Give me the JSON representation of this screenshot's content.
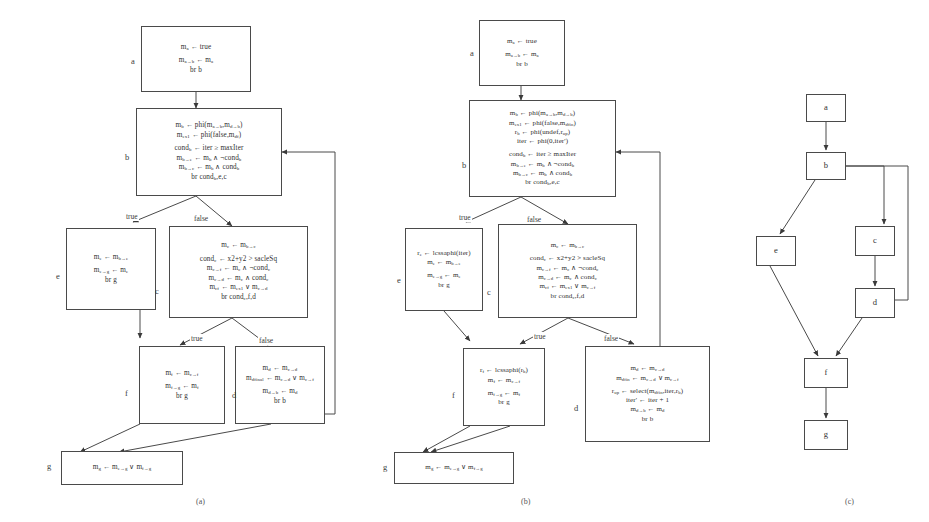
{
  "figure": {
    "captions": [
      {
        "text": "(a)",
        "x": 196,
        "y": 497
      },
      {
        "text": "(b)",
        "x": 521,
        "y": 497
      },
      {
        "text": "(c)",
        "x": 845,
        "y": 497
      }
    ]
  },
  "panel_a": {
    "name": "original-ssa-cfg",
    "labels": [
      {
        "text": "a",
        "x": 131,
        "y": 56
      },
      {
        "text": "b",
        "x": 125,
        "y": 152
      },
      {
        "text": "e",
        "x": 56,
        "y": 271
      },
      {
        "text": "c",
        "x": 155,
        "y": 286
      },
      {
        "text": "f",
        "x": 125,
        "y": 388
      },
      {
        "text": "d",
        "x": 232,
        "y": 390
      },
      {
        "text": "g",
        "x": 47,
        "y": 461
      }
    ],
    "edge_labels": [
      {
        "text": "true",
        "x": 125,
        "y": 212
      },
      {
        "text": "false",
        "x": 193,
        "y": 214
      },
      {
        "text": "true",
        "x": 190,
        "y": 334
      },
      {
        "text": "false",
        "x": 258,
        "y": 336
      }
    ],
    "blocks": {
      "a": {
        "lines": [
          "m<sub>a</sub> ← true",
          "",
          "m<sub>a→b</sub> ← m<sub>a</sub>",
          "br b"
        ]
      },
      "b": {
        "lines": [
          "m<sub>b</sub> ← phi(m<sub>a→b</sub>,m<sub>d→b</sub>)",
          "m<sub>ex1</sub> ← phi(false,m<sub>df</sub>)",
          "",
          "cond<sub>b</sub> ← iter ≥ maxIter",
          "m<sub>b→e</sub> ← m<sub>b</sub> ∧ ¬cond<sub>b</sub>",
          "m<sub>b→c</sub> ← m<sub>b</sub> ∧ cond<sub>b</sub>",
          "br cond<sub>b</sub>,e,c"
        ]
      },
      "e": {
        "lines": [
          "m<sub>e</sub> ← m<sub>b→e</sub>",
          "",
          "m<sub>e→g</sub> ← m<sub>e</sub>",
          "br g"
        ]
      },
      "c": {
        "lines": [
          "m<sub>c</sub> ← m<sub>b→c</sub>",
          "",
          "cond<sub>c</sub> ← x2+y2 &gt; sacleSq",
          "m<sub>c→f</sub> ← m<sub>c</sub> ∧ ¬cond<sub>c</sub>",
          "m<sub>c→d</sub> ← m<sub>c</sub> ∧ cond<sub>c</sub>",
          "m<sub>cf</sub> ← m<sub>ex1</sub> ∨ m<sub>c→d</sub>",
          "br cond<sub>c</sub>,f,d"
        ]
      },
      "f": {
        "lines": [
          "m<sub>f</sub> ← m<sub>c→f</sub>",
          "",
          "m<sub>f→g</sub> ← m<sub>f</sub>",
          "br g"
        ]
      },
      "d": {
        "lines": [
          "m<sub>d</sub> ← m<sub>c→d</sub>",
          "m<sub>dfinal</sub> ← m<sub>c→d</sub> ∨ m<sub>c→f</sub>",
          "",
          "m<sub>d→b</sub> ← m<sub>d</sub>",
          "br b"
        ]
      },
      "g": {
        "lines": [
          "m<sub>g</sub> ← m<sub>e→g</sub> ∨ m<sub>f→g</sub>"
        ]
      }
    }
  },
  "panel_b": {
    "name": "transformed-ssa-cfg",
    "labels": [
      {
        "text": "a",
        "x": 470,
        "y": 48
      },
      {
        "text": "b",
        "x": 462,
        "y": 160
      },
      {
        "text": "e",
        "x": 397,
        "y": 275
      },
      {
        "text": "c",
        "x": 487,
        "y": 287
      },
      {
        "text": "f",
        "x": 452,
        "y": 390
      },
      {
        "text": "d",
        "x": 574,
        "y": 403
      },
      {
        "text": "g",
        "x": 383,
        "y": 462
      }
    ],
    "edge_labels": [
      {
        "text": "true",
        "x": 458,
        "y": 213
      },
      {
        "text": "false",
        "x": 526,
        "y": 215
      },
      {
        "text": "true",
        "x": 533,
        "y": 332
      },
      {
        "text": "false",
        "x": 603,
        "y": 334
      }
    ],
    "blocks": {
      "a": {
        "lines": [
          "m<sub>a</sub> ← true",
          "",
          "m<sub>a→b</sub> ← m<sub>a</sub>",
          "br b"
        ]
      },
      "b": {
        "lines": [
          "m<sub>b</sub> ← phi(m<sub>a→b</sub>,m<sub>d→b</sub>)",
          "m<sub>ex1</sub> ← phi(false,m<sub>dfin</sub>)",
          "r<sub>b</sub> ← phi(undef,r<sub>up</sub>)",
          "iter ← phi(0,iter')",
          "",
          "cond<sub>b</sub> ← iter ≥ maxIter",
          "m<sub>b→e</sub> ← m<sub>b</sub> ∧ ¬cond<sub>b</sub>",
          "m<sub>b→c</sub> ← m<sub>b</sub> ∧ cond<sub>b</sub>",
          "br cond<sub>b</sub>,e,c"
        ]
      },
      "e": {
        "lines": [
          "r<sub>e</sub> ← lcssaphi(iter)",
          "m<sub>e</sub> ← m<sub>b→e</sub>",
          "",
          "m<sub>e→g</sub> ← m<sub>e</sub>",
          "br g"
        ]
      },
      "c": {
        "lines": [
          "m<sub>c</sub> ← m<sub>b→c</sub>",
          "",
          "cond<sub>c</sub> ← x2+y2 &gt; sacleSq",
          "m<sub>c→f</sub> ← m<sub>c</sub> ∧ ¬cond<sub>c</sub>",
          "m<sub>c→d</sub> ← m<sub>c</sub> ∧ cond<sub>c</sub>",
          "m<sub>cf</sub> ← m<sub>ex1</sub> ∨ m<sub>c→f</sub>",
          "br cond<sub>c</sub>,f,d"
        ]
      },
      "f": {
        "lines": [
          "r<sub>f</sub> ← lcssaphi(r<sub>b</sub>)",
          "m<sub>f</sub> ← m<sub>c→f</sub>",
          "",
          "m<sub>f→g</sub> ← m<sub>f</sub>",
          "br g"
        ]
      },
      "d": {
        "lines": [
          "m<sub>d</sub> ← m<sub>c→d</sub>",
          "m<sub>dfin</sub> ← m<sub>c→d</sub> ∨ m<sub>c→f</sub>",
          "",
          "r<sub>up</sub> ← select(m<sub>dfin</sub>,iter,r<sub>b</sub>)",
          "iter' ← iter + 1",
          "m<sub>d→b</sub> ← m<sub>d</sub>",
          "br b"
        ]
      },
      "g": {
        "lines": [
          "m<sub>g</sub> ← m<sub>e→g</sub> ∨ m<sub>f→g</sub>"
        ]
      }
    }
  },
  "panel_c": {
    "name": "abstract-cfg",
    "nodes": [
      {
        "id": "a",
        "label": "a",
        "x": 806,
        "y": 94,
        "w": 40,
        "h": 28
      },
      {
        "id": "b",
        "label": "b",
        "x": 806,
        "y": 152,
        "w": 40,
        "h": 28
      },
      {
        "id": "e",
        "label": "e",
        "x": 756,
        "y": 236,
        "w": 40,
        "h": 30
      },
      {
        "id": "c",
        "label": "c",
        "x": 855,
        "y": 226,
        "w": 40,
        "h": 30
      },
      {
        "id": "d",
        "label": "d",
        "x": 855,
        "y": 288,
        "w": 40,
        "h": 30
      },
      {
        "id": "f",
        "label": "f",
        "x": 804,
        "y": 358,
        "w": 44,
        "h": 30
      },
      {
        "id": "g",
        "label": "g",
        "x": 804,
        "y": 420,
        "w": 44,
        "h": 30
      }
    ],
    "edges": [
      {
        "from": "a",
        "to": "b"
      },
      {
        "from": "b",
        "to": "e"
      },
      {
        "from": "b",
        "to": "c"
      },
      {
        "from": "c",
        "to": "d"
      },
      {
        "from": "d",
        "to": "b",
        "kind": "back-edge"
      },
      {
        "from": "e",
        "to": "f"
      },
      {
        "from": "d",
        "to": "f"
      },
      {
        "from": "f",
        "to": "g"
      }
    ]
  }
}
